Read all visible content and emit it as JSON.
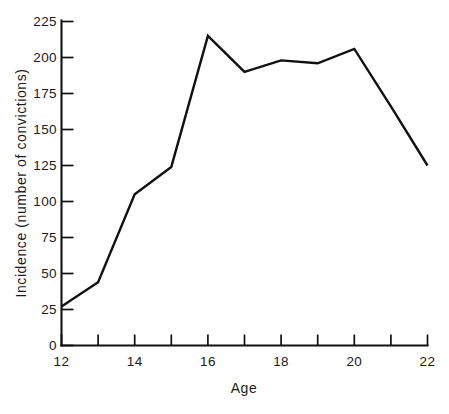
{
  "chart_data": {
    "type": "line",
    "title": "",
    "subtitle": "",
    "xlabel": "Age",
    "ylabel": "Incidence (number of convictions)",
    "x": [
      12,
      13,
      14,
      15,
      16,
      17,
      18,
      19,
      20,
      21,
      22
    ],
    "values": [
      27,
      44,
      105,
      124,
      215,
      190,
      198,
      196,
      206,
      166,
      125
    ],
    "series": [
      {
        "name": "Incidence",
        "values": [
          27,
          44,
          105,
          124,
          215,
          190,
          198,
          196,
          206,
          166,
          125
        ]
      }
    ],
    "xlim": [
      12,
      22
    ],
    "ylim": [
      0,
      225
    ],
    "x_ticks": [
      12,
      13,
      14,
      15,
      16,
      17,
      18,
      19,
      20,
      21,
      22
    ],
    "x_tick_labels": [
      "12",
      "",
      "14",
      "",
      "16",
      "",
      "18",
      "",
      "20",
      "",
      "22"
    ],
    "y_ticks": [
      0,
      25,
      50,
      75,
      100,
      125,
      150,
      175,
      200,
      225
    ],
    "y_tick_labels": [
      "0",
      "25",
      "50",
      "75",
      "100",
      "125",
      "150",
      "175",
      "200",
      "225"
    ],
    "grid": false,
    "legend": false,
    "legend_position": "none",
    "line_color": "#111111",
    "background_color": "#ffffff"
  },
  "axes": {
    "y_axis_label": "Incidence (number of convictions)",
    "x_axis_label": "Age",
    "y_tick_0": "0",
    "y_tick_25": "25",
    "y_tick_50": "50",
    "y_tick_75": "75",
    "y_tick_100": "100",
    "y_tick_125": "125",
    "y_tick_150": "150",
    "y_tick_175": "175",
    "y_tick_200": "200",
    "y_tick_225": "225",
    "x_tick_12": "12",
    "x_tick_14": "14",
    "x_tick_16": "16",
    "x_tick_18": "18",
    "x_tick_20": "20",
    "x_tick_22": "22"
  },
  "caption": {
    "text": ""
  }
}
